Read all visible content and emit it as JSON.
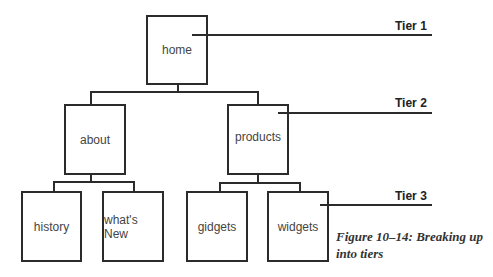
{
  "diagram": {
    "nodes": {
      "home": "home",
      "about": "about",
      "products": "products",
      "history": "history",
      "whats_new": "what's New",
      "gidgets": "gidgets",
      "widgets": "widgets"
    },
    "tiers": {
      "tier1": "Tier 1",
      "tier2": "Tier 2",
      "tier3": "Tier 3"
    },
    "edges": [
      [
        "home",
        "about"
      ],
      [
        "home",
        "products"
      ],
      [
        "about",
        "history"
      ],
      [
        "about",
        "whats_new"
      ],
      [
        "products",
        "gidgets"
      ],
      [
        "products",
        "widgets"
      ]
    ],
    "caption_line1": "Figure 10–14: Breaking up",
    "caption_line2": "into tiers"
  }
}
